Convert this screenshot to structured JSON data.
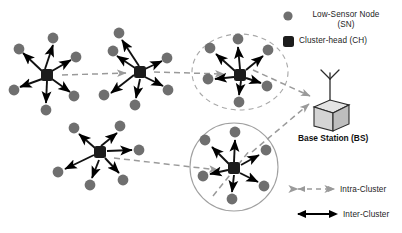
{
  "figure": {
    "background": "#ffffff",
    "colors": {
      "sensor_node": "#6f6f6f",
      "cluster_head": "#1c1c1c",
      "inter_cluster_link": "#000000",
      "intra_cluster_link": "#9a9a9a",
      "cluster_outline": "#9a9a9a",
      "base_station_fill": "#d8d8d8",
      "base_station_stroke": "#2b2b2b"
    }
  },
  "legend_nodes": {
    "sensor": {
      "label_line1": "Low-Sensor Node",
      "label_line2": "(SN)",
      "marker": "circle-icon"
    },
    "cluster_head": {
      "label": "Cluster-head (CH)",
      "marker": "square-icon"
    }
  },
  "legend_links": {
    "intra": {
      "label": "Intra-Cluster",
      "style": "dashed-double-arrow"
    },
    "inter": {
      "label": "Inter-Cluster",
      "style": "solid-double-arrow"
    }
  },
  "base_station": {
    "label": "Base Station (BS)",
    "icon": "antenna-cube-icon"
  },
  "clusters": [
    {
      "id": "cluster-1",
      "head": [
        47,
        75
      ],
      "nodes": [
        [
          19,
          49
        ],
        [
          53,
          38
        ],
        [
          76,
          57
        ],
        [
          74,
          96
        ],
        [
          46,
          110
        ],
        [
          14,
          90
        ]
      ],
      "highlight": "none"
    },
    {
      "id": "cluster-2",
      "head": [
        140,
        72
      ],
      "nodes": [
        [
          113,
          51
        ],
        [
          167,
          58
        ],
        [
          168,
          90
        ],
        [
          135,
          105
        ],
        [
          104,
          95
        ],
        [
          119,
          33
        ]
      ],
      "highlight": "none"
    },
    {
      "id": "cluster-3",
      "head": [
        240,
        75
      ],
      "nodes": [
        [
          210,
          48
        ],
        [
          238,
          39
        ],
        [
          268,
          50
        ],
        [
          267,
          86
        ],
        [
          239,
          102
        ],
        [
          208,
          79
        ]
      ],
      "highlight": "dashed-ellipse",
      "ellipse": [
        240,
        72,
        48,
        38
      ]
    },
    {
      "id": "cluster-4",
      "head": [
        100,
        152
      ],
      "nodes": [
        [
          74,
          128
        ],
        [
          120,
          126
        ],
        [
          139,
          150
        ],
        [
          123,
          180
        ],
        [
          90,
          185
        ],
        [
          58,
          172
        ]
      ],
      "highlight": "none"
    },
    {
      "id": "cluster-5",
      "head": [
        234,
        168
      ],
      "nodes": [
        [
          205,
          140
        ],
        [
          235,
          132
        ],
        [
          266,
          150
        ],
        [
          264,
          186
        ],
        [
          232,
          199
        ],
        [
          203,
          176
        ]
      ],
      "highlight": "solid-circle",
      "circle": [
        234,
        167,
        44
      ]
    }
  ],
  "intra_links": [
    {
      "from": "cluster-1",
      "to": "cluster-2"
    },
    {
      "from": "cluster-2",
      "to": "cluster-3"
    },
    {
      "from": "cluster-4",
      "to": "cluster-5"
    },
    {
      "from": "cluster-3",
      "to": "base-station"
    },
    {
      "from": "cluster-5",
      "to": "base-station"
    }
  ]
}
